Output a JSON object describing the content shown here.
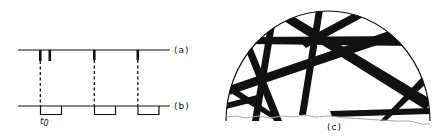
{
  "figure": {
    "panels": [
      {
        "id": "a",
        "label": "(a)",
        "description": "Timeline with impulse marks"
      },
      {
        "id": "b",
        "label": "(b)",
        "description": "Timeline with rectangular pulses",
        "tick_label": "t0"
      },
      {
        "id": "c",
        "label": "(c)",
        "description": "Semicircular cross-section with crossing dark bands"
      }
    ],
    "colors": {
      "ink": "#111111",
      "background": "#ffffff",
      "paper_edge": "#bbbbbb"
    }
  },
  "labels": {
    "a": "(a)",
    "b": "(b)",
    "c": "(c)",
    "t0_main": "t",
    "t0_sub": "0"
  }
}
